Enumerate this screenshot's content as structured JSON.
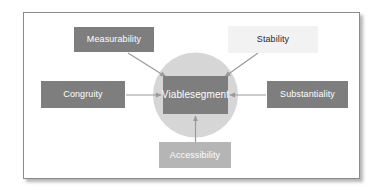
{
  "figure": {
    "type": "radial-concept-diagram",
    "center": {
      "label": "Viable\nsegment",
      "line1": "Viable",
      "line2": "segment",
      "fill": "#7e7e7e",
      "text_color": "#ffffff"
    },
    "halo": {
      "shape": "circle",
      "fill": "#d6d6d6"
    },
    "frame": {
      "background": "#ffffff",
      "border_color": "#8b8b8b",
      "shadow": true
    },
    "criteria": [
      {
        "id": "measurability",
        "label": "Measurability",
        "position": "top-left",
        "fill": "#7e7e7e",
        "text_color": "#ffffff",
        "arrow": "diagonal-down-right"
      },
      {
        "id": "stability",
        "label": "Stability",
        "position": "top-right",
        "fill": "#f2f2f2",
        "text_color": "#2b2b2b",
        "arrow": "diagonal-down-left"
      },
      {
        "id": "congruity",
        "label": "Congruity",
        "position": "left",
        "fill": "#7e7e7e",
        "text_color": "#ffffff",
        "arrow": "right"
      },
      {
        "id": "substantiality",
        "label": "Substantiality",
        "position": "right",
        "fill": "#7e7e7e",
        "text_color": "#ffffff",
        "arrow": "left"
      },
      {
        "id": "accessibility",
        "label": "Accessibility",
        "position": "bottom",
        "fill": "#b5b5b5",
        "text_color": "#ffffff",
        "arrow": "up"
      }
    ],
    "arrow_color": "#9a9a9a"
  }
}
